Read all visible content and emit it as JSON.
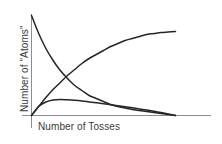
{
  "figure": {
    "background_color": "#ffffff",
    "curve_color": "#262626",
    "axis_color": "#8d8d8d",
    "text_color": "#3a3a3a"
  },
  "axes": {
    "x_label": "Number of Tosses",
    "y_label": "Number of \"Atoms\"",
    "x_tick_labels": [],
    "y_tick_labels": [],
    "grid": false
  },
  "chart_data": {
    "type": "line",
    "title": "",
    "subtitle": "",
    "xlabel": "Number of Tosses",
    "ylabel": "Number of \"Atoms\"",
    "xlim": [
      0,
      100
    ],
    "ylim": [
      0,
      100
    ],
    "grid": false,
    "legend_position": "none",
    "annotations": [],
    "x": [
      0,
      5,
      10,
      15,
      20,
      25,
      30,
      35,
      40,
      45,
      50,
      55,
      60,
      65,
      70,
      75,
      80,
      85,
      90,
      95,
      100
    ],
    "series": [
      {
        "name": "decay",
        "description": "Exponential decay of remaining parent \"atoms\" starting at full amount",
        "values": [
          100,
          82,
          67,
          55,
          45,
          37,
          30,
          25,
          20,
          17,
          14,
          11,
          9,
          7.5,
          6,
          5,
          4,
          3,
          2,
          1,
          0
        ]
      },
      {
        "name": "growth",
        "description": "Saturating accumulation of decayed product rising from zero",
        "values": [
          0,
          9,
          18,
          26,
          33,
          40,
          46,
          52,
          57,
          61,
          65,
          69,
          72,
          75,
          77,
          79,
          81,
          82,
          83,
          83.5,
          84
        ]
      },
      {
        "name": "hump",
        "description": "Low intermediate daughter curve: rises to a small early peak then slowly decays to zero",
        "values": [
          0,
          9,
          13.5,
          15.5,
          16,
          15.7,
          15.2,
          14.5,
          13.6,
          12.7,
          11.8,
          10.8,
          9.8,
          8.8,
          7.7,
          6.6,
          5.4,
          4.2,
          3.0,
          1.6,
          0
        ]
      }
    ]
  }
}
